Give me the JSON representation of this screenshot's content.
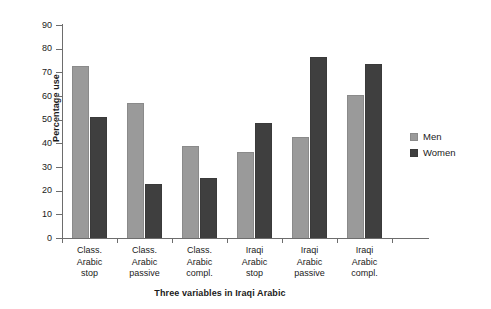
{
  "chart_data": {
    "type": "bar",
    "title": "",
    "xlabel": "Three variables in Iraqi Arabic",
    "ylabel": "Percentage use",
    "ylim": [
      0,
      90
    ],
    "ytick_step": 10,
    "yticks": [
      90,
      80,
      70,
      60,
      50,
      40,
      30,
      20,
      10,
      0
    ],
    "grid": false,
    "legend_position": "right",
    "categories": [
      "Class. Arabic stop",
      "Class. Arabic passive",
      "Class. Arabic compl.",
      "Iraqi Arabic stop",
      "Iraqi Arabic passive",
      "Iraqi Arabic compl."
    ],
    "category_lines": [
      [
        "Class.",
        "Arabic",
        "stop"
      ],
      [
        "Class.",
        "Arabic",
        "passive"
      ],
      [
        "Class.",
        "Arabic",
        "compl."
      ],
      [
        "Iraqi",
        "Arabic",
        "stop"
      ],
      [
        "Iraqi",
        "Arabic",
        "passive"
      ],
      [
        "Iraqi",
        "Arabic",
        "compl."
      ]
    ],
    "series": [
      {
        "name": "Men",
        "color": "#9a9a9a",
        "values": [
          72.5,
          57,
          39,
          36.5,
          42.5,
          60.5
        ]
      },
      {
        "name": "Women",
        "color": "#3f3f3f",
        "values": [
          51,
          23,
          25.5,
          48.5,
          76.5,
          73.5
        ]
      }
    ]
  },
  "legend": {
    "items": [
      {
        "label": "Men"
      },
      {
        "label": "Women"
      }
    ]
  },
  "colors": {
    "men": "#9a9a9a",
    "women": "#3f3f3f",
    "axis": "#6d6d6d",
    "text": "#1a1a1a",
    "background": "#ffffff"
  }
}
